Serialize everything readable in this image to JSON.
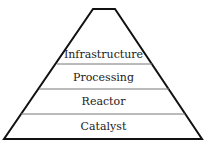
{
  "diagram": {
    "type": "pyramid",
    "colors": {
      "outline": "#111111",
      "divider": "#666666",
      "text": "#1a1a1a",
      "background": "#ffffff"
    },
    "layers_top_to_bottom": [
      {
        "label": "Infrastructure"
      },
      {
        "label": "Processing"
      },
      {
        "label": "Reactor"
      },
      {
        "label": "Catalyst"
      }
    ]
  }
}
